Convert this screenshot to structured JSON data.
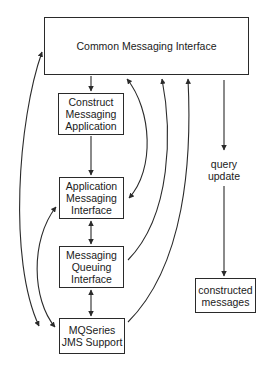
{
  "diagram": {
    "nodes": {
      "common": {
        "label": "Common Messaging Interface"
      },
      "construct": {
        "lines": [
          "Construct",
          "Messaging",
          "Application"
        ]
      },
      "ami": {
        "lines": [
          "Application",
          "Messaging",
          "Interface"
        ]
      },
      "mqi": {
        "lines": [
          "Messaging",
          "Queuing",
          "Interface"
        ]
      },
      "jms": {
        "lines": [
          "MQSeries",
          "JMS Support"
        ]
      },
      "constructed": {
        "lines": [
          "constructed",
          "messages"
        ]
      }
    },
    "edge_labels": {
      "query_update": [
        "query",
        "update"
      ]
    },
    "edges": [
      {
        "from": "common",
        "to": "construct",
        "type": "arrow"
      },
      {
        "from": "construct",
        "to": "ami",
        "type": "arrow"
      },
      {
        "from": "ami",
        "to": "mqi",
        "type": "bidirectional"
      },
      {
        "from": "mqi",
        "to": "jms",
        "type": "bidirectional"
      },
      {
        "from": "common",
        "to": "jms",
        "type": "bidirectional",
        "side": "left-outer"
      },
      {
        "from": "ami",
        "to": "jms",
        "type": "bidirectional",
        "side": "left-inner"
      },
      {
        "from": "common",
        "to": "ami",
        "type": "bidirectional",
        "side": "right"
      },
      {
        "from": "mqi",
        "to": "common",
        "type": "arrow",
        "side": "right"
      },
      {
        "from": "jms",
        "to": "common",
        "type": "arrow",
        "side": "right"
      },
      {
        "from": "common",
        "to": "constructed",
        "type": "arrow",
        "label": "query update"
      }
    ],
    "colors": {
      "line": "#2a2a2a",
      "background": "#ffffff"
    }
  }
}
